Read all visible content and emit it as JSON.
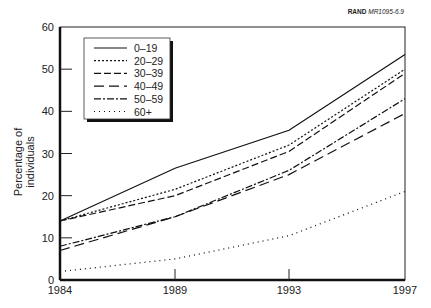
{
  "credit": {
    "org": "RAND",
    "code": "MR1095-6.9"
  },
  "chart_data": {
    "type": "line",
    "title": "",
    "xlabel": "",
    "ylabel": "Percentage of individuals",
    "x": [
      "1984",
      "1989",
      "1993",
      "1997"
    ],
    "ylim": [
      0,
      60
    ],
    "yticks": [
      0,
      10,
      20,
      30,
      40,
      50,
      60
    ],
    "grid": false,
    "legend_position": "upper left",
    "series": [
      {
        "name": "0–19",
        "style": "solid",
        "values": [
          14,
          26.5,
          35.5,
          53.5
        ]
      },
      {
        "name": "20–29",
        "style": "short-dash",
        "values": [
          14,
          21.5,
          32,
          50
        ]
      },
      {
        "name": "30–39",
        "style": "long-dash",
        "values": [
          14,
          20,
          30.5,
          49
        ]
      },
      {
        "name": "40–49",
        "style": "longer-dash",
        "values": [
          7,
          15,
          25,
          39.5
        ]
      },
      {
        "name": "50–59",
        "style": "dash-dot",
        "values": [
          8,
          15,
          26,
          43
        ]
      },
      {
        "name": "60+",
        "style": "dotted",
        "values": [
          2,
          5,
          10.5,
          21
        ]
      }
    ]
  }
}
